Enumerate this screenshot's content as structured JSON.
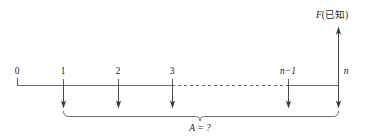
{
  "figure": {
    "type": "cash-flow-timeline-diagram",
    "background_color": "#ffffff",
    "line_color": "#6d6d6d",
    "arrow_color": "#3a3a3a",
    "text_color": "#1c1c1c"
  },
  "axis": {
    "start_x": 17,
    "end_x": 338,
    "y": 85,
    "dash_start_x": 172,
    "dash_end_x": 288,
    "left_cap_top_y": 78
  },
  "timeline": {
    "period_labels": [
      "0",
      "1",
      "2",
      "3",
      "n−1",
      "n"
    ],
    "period_positions": [
      17,
      63,
      118,
      172,
      288,
      338
    ],
    "label_y": 74,
    "italic_flags": [
      false,
      false,
      false,
      false,
      true,
      true
    ],
    "label_offsets_x": [
      0,
      0,
      0,
      0,
      0,
      8
    ]
  },
  "payment_arrows": {
    "direction": "down",
    "label": "A",
    "positions": [
      63,
      118,
      172,
      288,
      338
    ],
    "top_y": 85,
    "tip_y": 108
  },
  "future_value_arrow": {
    "direction": "up",
    "x": 338,
    "base_y": 85,
    "tip_y": 27,
    "label_text": "F(已知)",
    "label_variable": "F",
    "label_paren_open": "(",
    "label_note": "已知",
    "label_paren_close": ")",
    "label_x": 332,
    "label_y": 18
  },
  "brace": {
    "left_x": 63,
    "right_x": 338,
    "top_y": 112,
    "bottom_y": 117,
    "mid_x": 200,
    "notch_depth": 5,
    "label": "A = ?",
    "label_x": 200,
    "label_y": 130
  }
}
